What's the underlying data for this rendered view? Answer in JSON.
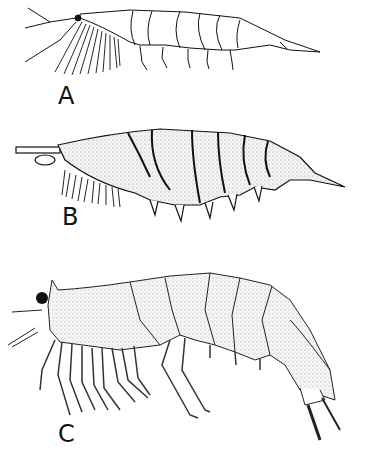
{
  "figure": {
    "panels": [
      {
        "label": "A",
        "description": "Crustacean larva, line drawing, lateral view with antennae and setose limbs"
      },
      {
        "label": "B",
        "description": "Crustacean, stippled drawing, lateral view with elongate telson"
      },
      {
        "label": "C",
        "description": "Crustacean adult, stippled drawing, lateral view with rostrum, eye and walking legs"
      }
    ]
  }
}
